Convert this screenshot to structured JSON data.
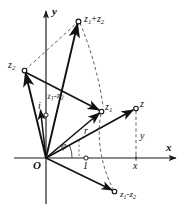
{
  "figure": {
    "background_color": "#ffffff",
    "stroke_color": "#1a1a1a",
    "dashed_color": "#555555"
  },
  "axes": {
    "x_label": "x",
    "y_label": "y",
    "origin_label": "O",
    "unit_label": "1",
    "imaginary_unit_label": "i"
  },
  "points": [
    {
      "key": "z_sum",
      "label_main": "z",
      "sub1": "1",
      "op": "+",
      "label2": "z",
      "sub2": "2",
      "text": "z1+z2"
    },
    {
      "key": "z2",
      "label_main": "z",
      "sub1": "2",
      "text": "z2"
    },
    {
      "key": "z1",
      "label_main": "z",
      "sub1": "1",
      "text": "z1"
    },
    {
      "key": "z",
      "label_main": "z",
      "text": "z"
    },
    {
      "key": "z_diff",
      "label_main": "z",
      "sub1": "1",
      "op": "-",
      "label2": "z",
      "sub2": "2",
      "text": "z1-z2"
    }
  ],
  "labels": {
    "z_sum_base": "z",
    "z_sum_sub1": "1",
    "z_sum_op": "+",
    "z_sum_base2": "z",
    "z_sum_sub2": "2",
    "z2_base": "z",
    "z2_sub": "2",
    "z1_base": "z",
    "z1_sub": "1",
    "z_plain": "z",
    "diff_mid_base": "z",
    "diff_mid_sub1": "1",
    "diff_mid_op": "-",
    "diff_mid_base2": "z",
    "diff_mid_sub2": "2",
    "diff_bot_base": "z",
    "diff_bot_sub1": "1",
    "diff_bot_op": "-",
    "diff_bot_base2": "z",
    "diff_bot_sub2": "2",
    "modulus": "r",
    "argument": "φ",
    "real_part": "x",
    "imag_part": "y",
    "axis_x": "x",
    "axis_y": "y",
    "origin": "O",
    "unit": "1",
    "imag_unit": "i"
  },
  "geometry": {
    "origin": {
      "x": 46,
      "y": 158
    },
    "unit_mark": {
      "x": 86,
      "y": 158
    },
    "i_mark": {
      "x": 46,
      "y": 115
    },
    "z": {
      "x": 136,
      "y": 108
    },
    "z_foot": {
      "x": 136,
      "y": 158
    },
    "z1": {
      "x": 102,
      "y": 111
    },
    "z2": {
      "x": 24,
      "y": 70
    },
    "z_sum": {
      "x": 79,
      "y": 21
    },
    "z_diff": {
      "x": 115,
      "y": 192
    },
    "x_axis_end": {
      "x": 178,
      "y": 158
    },
    "y_axis_top": {
      "x": 46,
      "y": 10
    }
  }
}
